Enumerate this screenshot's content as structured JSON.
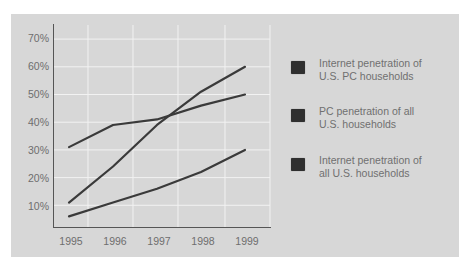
{
  "chart_data": {
    "type": "line",
    "title": "",
    "xlabel": "",
    "ylabel": "",
    "x": [
      "1995",
      "1996",
      "1997",
      "1998",
      "1999"
    ],
    "y_ticks": [
      "10%",
      "20%",
      "30%",
      "40%",
      "50%",
      "60%",
      "70%"
    ],
    "ylim": [
      0,
      70
    ],
    "grid": true,
    "legend_position": "right",
    "series": [
      {
        "name": "Internet penetration of U.S. PC households",
        "values": [
          11,
          24,
          39,
          51,
          60
        ],
        "color": "#3a3a3a"
      },
      {
        "name": "PC penetration of all U.S. households",
        "values": [
          31,
          39,
          41,
          46,
          50
        ],
        "color": "#3a3a3a"
      },
      {
        "name": "Internet penetration of all U.S. households",
        "values": [
          6,
          11,
          16,
          22,
          30
        ],
        "color": "#3a3a3a"
      }
    ]
  },
  "axis": {
    "y_labels": [
      "70%",
      "60%",
      "50%",
      "40%",
      "30%",
      "20%",
      "10%"
    ],
    "x_labels": [
      "1995",
      "1996",
      "1997",
      "1998",
      "1999"
    ]
  },
  "legend": {
    "items": [
      {
        "line1": "Internet penetration of",
        "line2": "U.S. PC households",
        "color": "#2f2f2f"
      },
      {
        "line1": "PC penetration of all",
        "line2": "U.S. households",
        "color": "#2f2f2f"
      },
      {
        "line1": "Internet penetration of",
        "line2": "all U.S. households",
        "color": "#2f2f2f"
      }
    ]
  },
  "colors": {
    "panel_bg": "#d7d7d7",
    "grid": "#f2f2f2",
    "axis": "#555555",
    "line": "#3a3a3a",
    "text": "#6e6e6e"
  }
}
